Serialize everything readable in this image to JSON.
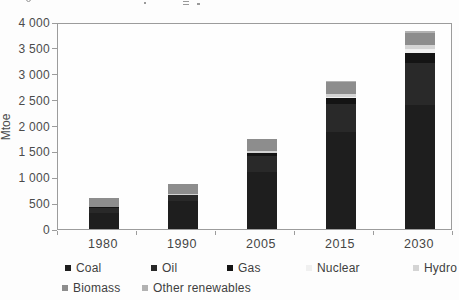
{
  "chart_data": {
    "type": "bar",
    "stacked": true,
    "title": "",
    "xlabel": "",
    "ylabel": "Mtoe",
    "ylim": [
      0,
      4000
    ],
    "ytick_step": 500,
    "ytick_labels": [
      "0",
      "500",
      "1 000",
      "1 500",
      "2 000",
      "2 500",
      "3 000",
      "3 500",
      "4 000"
    ],
    "categories": [
      "1980",
      "1990",
      "2005",
      "2015",
      "2030"
    ],
    "series": [
      {
        "name": "Coal",
        "color": "#1e1e1e",
        "values": [
          315,
          535,
          1095,
          1870,
          2400
        ]
      },
      {
        "name": "Oil",
        "color": "#292929",
        "values": [
          90,
          115,
          325,
          545,
          810
        ]
      },
      {
        "name": "Gas",
        "color": "#141414",
        "values": [
          15,
          15,
          40,
          110,
          200
        ]
      },
      {
        "name": "Nuclear",
        "color": "#f0f0f0",
        "values": [
          0,
          0,
          15,
          30,
          65
        ]
      },
      {
        "name": "Hydro",
        "color": "#d4d4d4",
        "values": [
          5,
          10,
          35,
          60,
          85
        ]
      },
      {
        "name": "Biomass",
        "color": "#8d8d8d",
        "values": [
          180,
          200,
          225,
          225,
          225
        ]
      },
      {
        "name": "Other renewables",
        "color": "#b2b2b2",
        "values": [
          0,
          0,
          5,
          15,
          35
        ]
      }
    ],
    "totals": [
      605,
      875,
      1740,
      2855,
      3820
    ],
    "grid": false,
    "legend_position": "bottom"
  }
}
